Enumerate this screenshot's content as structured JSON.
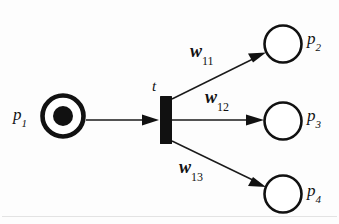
{
  "diagram": {
    "type": "petri-net",
    "background_color": "#fdfdfd",
    "stroke_color": "#111111",
    "places": [
      {
        "id": "p1",
        "label_base": "p",
        "label_sub": "1",
        "tokens": 1,
        "cx": 63,
        "cy": 116,
        "r": 21,
        "stroke_width": 4.5,
        "token_r": 10,
        "filled": true
      },
      {
        "id": "p2",
        "label_base": "p",
        "label_sub": "2",
        "tokens": 0,
        "cx": 283,
        "cy": 44,
        "r": 19,
        "stroke_width": 2.6,
        "token_r": 0,
        "filled": false
      },
      {
        "id": "p3",
        "label_base": "p",
        "label_sub": "3",
        "tokens": 0,
        "cx": 283,
        "cy": 121,
        "r": 19,
        "stroke_width": 2.6,
        "token_r": 0,
        "filled": false
      },
      {
        "id": "p4",
        "label_base": "p",
        "label_sub": "4",
        "tokens": 0,
        "cx": 283,
        "cy": 194,
        "r": 19,
        "stroke_width": 2.6,
        "token_r": 0,
        "filled": false
      }
    ],
    "transition": {
      "id": "t",
      "label_base": "t",
      "label_sub": "",
      "x": 160,
      "y": 96,
      "width": 12,
      "height": 48,
      "fill": "#111111"
    },
    "arcs": [
      {
        "id": "arc-p1-t",
        "from": "p1",
        "to": "t",
        "weight_base": "",
        "weight_sub": "",
        "x1": 86,
        "y1": 120,
        "x2": 159,
        "y2": 120
      },
      {
        "id": "arc-t-p2",
        "from": "t",
        "to": "p2",
        "weight_base": "w",
        "weight_sub": "11",
        "x1": 172,
        "y1": 98,
        "x2": 266,
        "y2": 52
      },
      {
        "id": "arc-t-p3",
        "from": "t",
        "to": "p3",
        "weight_base": "w",
        "weight_sub": "12",
        "x1": 172,
        "y1": 120,
        "x2": 263,
        "y2": 120
      },
      {
        "id": "arc-t-p4",
        "from": "t",
        "to": "p4",
        "weight_base": "w",
        "weight_sub": "13",
        "x1": 172,
        "y1": 142,
        "x2": 266,
        "y2": 187
      }
    ]
  }
}
